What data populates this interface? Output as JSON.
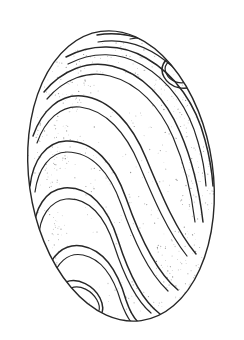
{
  "image": {
    "kind": "line-drawing",
    "subject": "ovoid shell specimen with spiral ridge bands",
    "width": 244,
    "height": 340,
    "background_color": "#ffffff",
    "ink_color": "#272727",
    "stipple_color": "#6f6f6f",
    "caption": ""
  },
  "geometry": {
    "outline": {
      "center_x": 121,
      "center_y": 176,
      "radius_x": 92,
      "radius_y": 146,
      "tilt_degrees": -8,
      "top_y": 31,
      "bottom_y": 321,
      "left_x": 29,
      "right_x": 214
    },
    "band_count": 9,
    "band_style": "double-line ridge",
    "ridge_gap_px": 4,
    "symmetry": "180-degree rotational"
  },
  "bands": [
    {
      "name": "band-1-apex-loop",
      "outer": "M 128 33 C 152 28 176 33 192 48 C 205 60 207 76 196 84 C 186 92 170 88 164 77 C 159 68 164 58 174 56",
      "inner": "M 130 39 C 152 35 172 40 186 53 C 196 62 198 74 190 80 C 182 86 170 82 166 73 C 163 66 168 60 175 60"
    },
    {
      "name": "band-2",
      "outer": "M 97 35 C 128 30 156 42 178 62 C 198 80 208 102 210 124",
      "inner": "M 98 42 C 127 37 153 49 173 67 C 192 84 202 104 204 126"
    },
    {
      "name": "band-3",
      "outer": "M 66 57 C 92 43 122 44 146 58 C 176 75 196 105 205 140 C 210 158 212 172 213 186",
      "inner": "M 68 64 C 93 51 120 52 142 65 C 170 81 189 109 198 142 C 203 159 205 172 206 186"
    },
    {
      "name": "band-4",
      "outer": "M 44 92 C 62 70 88 60 112 66 C 142 73 166 99 180 132 C 194 164 200 196 203 222",
      "inner": "M 47 99 C 64 79 88 70 110 76 C 138 83 160 107 173 137 C 186 167 192 197 195 222"
    },
    {
      "name": "band-5",
      "outer": "M 33 136 C 42 110 60 94 82 96 C 110 99 132 124 146 158 C 162 196 176 230 196 254",
      "inner": "M 37 143 C 45 120 61 105 80 107 C 106 110 126 133 139 164 C 154 200 168 232 187 256"
    },
    {
      "name": "band-6",
      "outer": "M 30 186 C 33 160 46 142 66 141 C 94 140 114 164 126 198 C 140 238 156 272 178 290",
      "inner": "M 35 192 C 38 169 50 152 67 152 C 92 152 110 173 121 204 C 134 241 148 272 168 291"
    },
    {
      "name": "band-7",
      "outer": "M 34 232 C 34 208 46 190 64 188 C 90 186 108 208 118 240 C 130 278 144 302 160 314",
      "inner": "M 39 238 C 39 217 50 201 66 199 C 89 197 105 217 114 245 C 125 279 137 301 151 313"
    },
    {
      "name": "band-8",
      "outer": "M 46 276 C 50 256 64 243 82 246 C 104 250 118 272 126 300 C 130 312 134 318 138 322",
      "inner": "M 52 281 C 56 263 68 252 83 255 C 102 259 114 278 121 302 C 125 313 128 318 131 322"
    },
    {
      "name": "band-9-base-loop",
      "outer": "M 60 308 C 54 298 56 286 66 282 C 78 277 94 286 100 298 C 106 310 102 320 88 322 C 76 324 64 320 56 312",
      "inner": "M 66 306 C 62 299 64 291 71 288 C 80 284 92 291 97 300 C 102 309 99 316 89 317 C 80 318 71 314 65 308"
    }
  ],
  "stipple_zones": [
    {
      "name": "stipple-upper-left",
      "cx": 72,
      "cy": 78,
      "rx": 30,
      "ry": 34,
      "density": 0.55
    },
    {
      "name": "stipple-left-mid",
      "cx": 50,
      "cy": 150,
      "rx": 22,
      "ry": 40,
      "density": 0.6
    },
    {
      "name": "stipple-left-lower",
      "cx": 48,
      "cy": 240,
      "rx": 20,
      "ry": 38,
      "density": 0.5
    },
    {
      "name": "stipple-upper-right",
      "cx": 180,
      "cy": 100,
      "rx": 28,
      "ry": 42,
      "density": 0.5
    },
    {
      "name": "stipple-right-mid",
      "cx": 196,
      "cy": 180,
      "rx": 20,
      "ry": 40,
      "density": 0.6
    },
    {
      "name": "stipple-right-lower",
      "cx": 180,
      "cy": 262,
      "rx": 26,
      "ry": 38,
      "density": 0.55
    },
    {
      "name": "stipple-center",
      "cx": 120,
      "cy": 176,
      "rx": 50,
      "ry": 70,
      "density": 0.18
    },
    {
      "name": "stipple-top",
      "cx": 126,
      "cy": 58,
      "rx": 36,
      "ry": 20,
      "density": 0.35
    },
    {
      "name": "stipple-bottom",
      "cx": 124,
      "cy": 300,
      "rx": 40,
      "ry": 20,
      "density": 0.4
    }
  ]
}
